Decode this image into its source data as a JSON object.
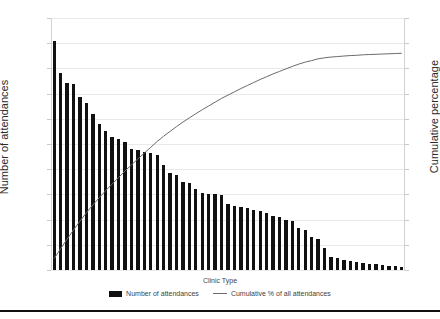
{
  "chart_data": {
    "type": "bar",
    "title": "",
    "xlabel": "Clinic Type",
    "ylabel": "Number of attendances",
    "y2label": "Cumulative percentage",
    "ylim": [
      0,
      2000
    ],
    "y2lim": [
      0,
      100
    ],
    "grid": true,
    "legend_position": "bottom",
    "left_tick_labels": [
      "2,000",
      "1,800",
      "1,600",
      "1,400",
      "1,200",
      "1,000",
      "800",
      "600",
      "400",
      "200",
      "0"
    ],
    "left_tick_values": [
      2000,
      1800,
      1600,
      1400,
      1200,
      1000,
      800,
      600,
      400,
      200,
      0
    ],
    "right_tick_labels": [
      "100%",
      "90%",
      "80%",
      "70%",
      "60%",
      "50%",
      "40%",
      "30%",
      "20%",
      "10%",
      "0%"
    ],
    "right_tick_values": [
      100,
      90,
      80,
      70,
      60,
      50,
      40,
      30,
      20,
      10,
      0
    ],
    "categories": [
      "C1",
      "C2",
      "C3",
      "C4",
      "C5",
      "C6",
      "C7",
      "C8",
      "C9",
      "C10",
      "C11",
      "C12",
      "C13",
      "C14",
      "C15",
      "C16",
      "C17",
      "C18",
      "C19",
      "C20",
      "C21",
      "C22",
      "C23",
      "C24",
      "C25",
      "C26",
      "C27",
      "C28",
      "C29",
      "C30",
      "C31",
      "C32",
      "C33",
      "C34",
      "C35",
      "C36",
      "C37",
      "C38",
      "C39",
      "C40",
      "C41",
      "C42",
      "C43",
      "C44",
      "C45",
      "C46",
      "C47",
      "C48",
      "C49",
      "C50",
      "C51",
      "C52",
      "C53",
      "C54",
      "C55"
    ],
    "series": [
      {
        "name": "Number of attendances",
        "type": "bar",
        "color": "#111111",
        "axis": "left",
        "values": [
          1820,
          1565,
          1485,
          1475,
          1375,
          1325,
          1240,
          1155,
          1105,
          1055,
          1040,
          1015,
          960,
          950,
          935,
          925,
          910,
          830,
          770,
          755,
          700,
          690,
          640,
          615,
          605,
          600,
          595,
          520,
          510,
          500,
          490,
          480,
          470,
          450,
          430,
          420,
          400,
          390,
          330,
          315,
          265,
          245,
          175,
          105,
          95,
          80,
          70,
          60,
          55,
          50,
          45,
          40,
          35,
          30,
          25
        ]
      },
      {
        "name": "Cumulative % of all attendances",
        "type": "line",
        "color": "#6b6b6b",
        "axis": "right",
        "values": [
          4.6,
          8.5,
          12.2,
          15.9,
          19.4,
          22.7,
          25.8,
          28.7,
          31.5,
          34.1,
          36.7,
          39.3,
          41.7,
          44.1,
          46.4,
          48.7,
          51.0,
          53.1,
          55.0,
          56.9,
          58.7,
          60.4,
          62.0,
          63.6,
          65.1,
          66.6,
          68.1,
          69.4,
          70.7,
          72.0,
          73.2,
          74.4,
          75.6,
          76.7,
          77.8,
          78.8,
          79.8,
          80.8,
          81.7,
          82.5,
          83.1,
          83.8,
          84.2,
          84.5,
          84.7,
          84.9,
          85.1,
          85.2,
          85.4,
          85.5,
          85.6,
          85.7,
          85.8,
          85.9,
          86.0
        ]
      }
    ],
    "legend": [
      {
        "label": "Number of attendances",
        "marker": "bar-swatch",
        "color": "#111111"
      },
      {
        "label": "Cumulative % of all attendances",
        "marker": "line-swatch",
        "color": "#6b6b6b"
      }
    ]
  }
}
